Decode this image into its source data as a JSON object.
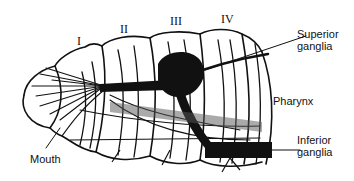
{
  "diagram": {
    "segment_labels": [
      "I",
      "II",
      "III",
      "IV"
    ],
    "labels": {
      "superior": "Superior\nganglia",
      "superior_line1": "Superior",
      "superior_line2": "ganglia",
      "pharynx": "Pharynx",
      "inferior_line1": "Inferior",
      "inferior_line2": "ganglia",
      "mouth": "Mouth"
    },
    "colors": {
      "ink": "#111111",
      "background": "#ffffff"
    }
  }
}
